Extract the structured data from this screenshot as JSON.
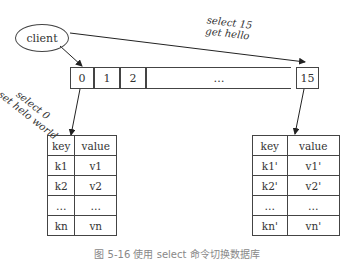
{
  "client": {
    "label": "client"
  },
  "commands": {
    "left": [
      "select 0",
      "set helo world"
    ],
    "right": [
      "select 15",
      "get hello"
    ]
  },
  "databases": {
    "cells": [
      "0",
      "1",
      "2",
      "…",
      "15"
    ]
  },
  "tables": {
    "left": {
      "header": [
        "key",
        "value"
      ],
      "rows": [
        [
          "k1",
          "v1"
        ],
        [
          "k2",
          "v2"
        ],
        [
          "…",
          "…"
        ],
        [
          "kn",
          "vn"
        ]
      ]
    },
    "right": {
      "header": [
        "key",
        "value"
      ],
      "rows": [
        [
          "k1'",
          "v1'"
        ],
        [
          "k2'",
          "v2'"
        ],
        [
          "…",
          "…"
        ],
        [
          "kn'",
          "vn'"
        ]
      ]
    }
  },
  "caption": "图 5-16  使用 select 命令切换数据库"
}
